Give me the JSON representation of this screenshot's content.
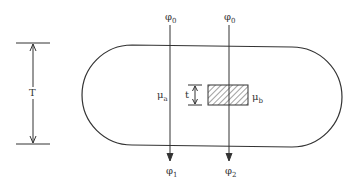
{
  "diagram": {
    "dimension_label": "T",
    "thickness_label": "t",
    "beams": [
      {
        "incident": "φ",
        "incident_sub": "0",
        "exit": "φ",
        "exit_sub": "1"
      },
      {
        "incident": "φ",
        "incident_sub": "0",
        "exit": "φ",
        "exit_sub": "2"
      }
    ],
    "media": {
      "a": {
        "symbol": "μ",
        "sub": "a"
      },
      "b": {
        "symbol": "μ",
        "sub": "b"
      }
    },
    "colors": {
      "stroke": "#333333",
      "hatch": "#444444",
      "background": "#ffffff"
    }
  }
}
